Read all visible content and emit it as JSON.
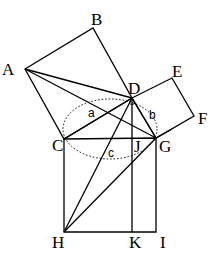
{
  "diagram": {
    "points": {
      "A": {
        "x": 25,
        "y": 69,
        "label": "A",
        "lx": 2,
        "ly": 75
      },
      "B": {
        "x": 93,
        "y": 28,
        "label": "B",
        "lx": 91,
        "ly": 25
      },
      "D": {
        "x": 132,
        "y": 98,
        "label": "D",
        "lx": 128,
        "ly": 94
      },
      "E": {
        "x": 172,
        "y": 78,
        "label": "E",
        "lx": 172,
        "ly": 77
      },
      "F": {
        "x": 194,
        "y": 116,
        "label": "F",
        "lx": 198,
        "ly": 124
      },
      "C": {
        "x": 64,
        "y": 139,
        "label": "C",
        "lx": 52,
        "ly": 151
      },
      "G": {
        "x": 156,
        "y": 138,
        "label": "G",
        "lx": 159,
        "ly": 152
      },
      "J": {
        "x": 132,
        "y": 139,
        "label": "J",
        "lx": 134,
        "ly": 152
      },
      "H": {
        "x": 64,
        "y": 232,
        "label": "H",
        "lx": 52,
        "ly": 248
      },
      "K": {
        "x": 132,
        "y": 232,
        "label": "K",
        "lx": 129,
        "ly": 248
      },
      "I": {
        "x": 156,
        "y": 232,
        "label": "I",
        "lx": 160,
        "ly": 248
      }
    },
    "side_labels": {
      "a": {
        "label": "a",
        "x": 88,
        "y": 117
      },
      "b": {
        "label": "b",
        "x": 149,
        "y": 119
      },
      "c": {
        "label": "c",
        "x": 108,
        "y": 157
      }
    },
    "colors": {
      "stroke": "#000000",
      "background": "#ffffff"
    }
  }
}
